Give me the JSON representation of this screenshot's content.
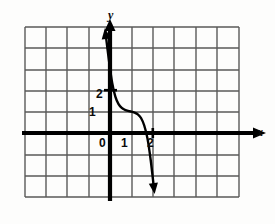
{
  "figure": {
    "title": "",
    "kind": "coordinate-grid-graph"
  },
  "labels": {
    "origin": "0",
    "x_tick_1": "1",
    "x_tick_2": "2",
    "y_tick_1": "1",
    "y_tick_2": "2",
    "x_axis": "x",
    "y_axis": "y"
  },
  "colors": {
    "grid": "#595959",
    "axis": "#000000",
    "curve": "#000000",
    "background": "#fdfdfc"
  },
  "chart_data": {
    "type": "line",
    "title": "",
    "xlabel": "x",
    "ylabel": "y",
    "grid": true,
    "legend": "none",
    "xlim": [
      -4,
      6
    ],
    "ylim": [
      -3,
      5
    ],
    "x_ticks": [
      0,
      1,
      2
    ],
    "y_ticks": [
      1,
      2
    ],
    "x_tick_labels": [
      "0",
      "1",
      "2"
    ],
    "y_tick_labels": [
      "1",
      "2"
    ],
    "grid_spacing": 1,
    "series": [
      {
        "name": "curve",
        "description": "decreasing cubic with flat inflection near (1, 1)",
        "arrow_start": true,
        "arrow_end": true,
        "x": [
          -0.2,
          -0.05,
          0.1,
          0.25,
          0.4,
          0.55,
          0.7,
          0.85,
          1.0,
          1.15,
          1.3,
          1.45,
          1.6,
          1.75,
          1.9,
          2.05
        ],
        "y": [
          4.6,
          3.4,
          2.35,
          1.7,
          1.35,
          1.17,
          1.08,
          1.03,
          1.0,
          0.95,
          0.87,
          0.7,
          0.35,
          -0.25,
          -1.25,
          -2.55
        ]
      }
    ]
  },
  "geometry": {
    "origin_px": [
      110,
      133
    ],
    "unit_px": 21.4,
    "grid_x": [
      25,
      46,
      67,
      89,
      110,
      132,
      153,
      174,
      196,
      217,
      239
    ],
    "grid_y": [
      27,
      48,
      70,
      91,
      112,
      133,
      155,
      176,
      197
    ],
    "plot_left": 25,
    "plot_right": 239,
    "plot_top": 27,
    "plot_bottom": 197
  }
}
